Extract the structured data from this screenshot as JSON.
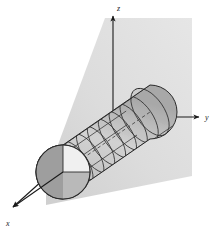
{
  "figure": {
    "background_color": "#ffffff",
    "axes": {
      "x": {
        "label": "x",
        "label_x": 10,
        "label_y": 225,
        "tip_x": 8,
        "tip_y": 210,
        "origin_x": 113,
        "origin_y": 117
      },
      "y": {
        "label": "y",
        "label_x": 207,
        "label_y": 120,
        "tip_x": 203,
        "tip_y": 117,
        "origin_x": 113,
        "origin_y": 117
      },
      "z": {
        "label": "z",
        "label_x": 117,
        "label_y": 10,
        "tip_x": 113,
        "tip_y": 12,
        "origin_x": 113,
        "origin_y": 117
      },
      "stroke_color": "#1a1a1a",
      "stroke_width": 1
    },
    "plane": {
      "name": "shaded-background-plane",
      "points": "105,18 192,18 192,176 46,205 46,176",
      "fill_start": "#e9e9e9",
      "fill_end": "#c9c9c9",
      "opacity": 0.95
    },
    "cylinder": {
      "name": "wireframe-cylinder",
      "axis_dashed": true,
      "body_fill": "#c0c0c0",
      "mesh_stroke": "#2b2b2b",
      "mesh_rings": 9,
      "mesh_longitudinals": 7,
      "end_cap": {
        "name": "circular-end-cap",
        "center_x": 63,
        "center_y": 172,
        "radius": 27,
        "quadrant_light_fill": "#f2f2f2",
        "quadrant_dark_fill": "#9b9b9b",
        "quadrant_mid_fill": "#b4b4b4",
        "stroke": "#2b2b2b"
      },
      "dome_cap": {
        "name": "domed-right-end",
        "center_x": 150,
        "center_y": 112
      }
    }
  }
}
